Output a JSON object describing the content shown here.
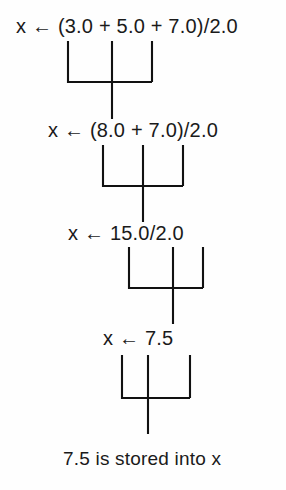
{
  "figure": {
    "background_color": "#fefefe",
    "ink_color": "#111111",
    "text_color": "#1a1a1a",
    "arrow_glyph": "←",
    "variable_name": "x"
  },
  "steps": [
    {
      "id": "step-1",
      "assign_var": "x",
      "arrow": "←",
      "expression": "(3.0 + 5.0 + 7.0)/2.0",
      "full_line": "x ← (3.0 + 5.0 + 7.0)/2.0"
    },
    {
      "id": "step-2",
      "assign_var": "x",
      "arrow": "←",
      "expression": "(8.0 + 7.0)/2.0",
      "full_line": "x ← (8.0 + 7.0)/2.0"
    },
    {
      "id": "step-3",
      "assign_var": "x",
      "arrow": "←",
      "expression": "15.0/2.0",
      "full_line": "x ← 15.0/2.0"
    },
    {
      "id": "step-4",
      "assign_var": "x",
      "arrow": "←",
      "expression": "7.5",
      "full_line": "x ← 7.5"
    }
  ],
  "result": {
    "value": "7.5",
    "phrase": "is stored into",
    "target_variable": "x",
    "full_line": "7.5 is stored into x"
  },
  "connectors": [
    {
      "id": "connector-1",
      "left_x": 68,
      "mid_x": 112,
      "right_x": 152,
      "top_y": 41,
      "bar_y": 82,
      "stem_bottom_y": 119
    },
    {
      "id": "connector-2",
      "left_x": 103,
      "mid_x": 143,
      "right_x": 183,
      "top_y": 145,
      "bar_y": 186,
      "stem_bottom_y": 222
    },
    {
      "id": "connector-3",
      "left_x": 129,
      "mid_x": 173,
      "right_x": 203,
      "top_y": 247,
      "bar_y": 288,
      "stem_bottom_y": 324
    },
    {
      "id": "connector-4",
      "left_x": 122,
      "mid_x": 148,
      "right_x": 190,
      "top_y": 350,
      "bar_y": 398,
      "stem_bottom_y": 434
    }
  ]
}
